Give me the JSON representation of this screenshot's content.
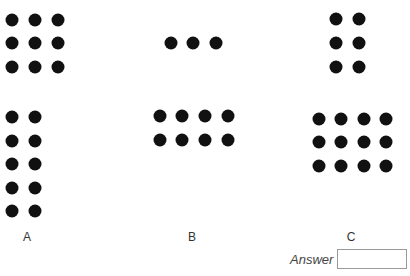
{
  "question": {
    "top_text_fragment": "",
    "options": [
      {
        "label": "A",
        "label_pos": [
          27,
          230
        ],
        "groups": [
          {
            "name": "top-grid",
            "cols_x": [
              12,
              35,
              58
            ],
            "rows_y": [
              20,
              43,
              67
            ]
          },
          {
            "name": "bottom-grid",
            "cols_x": [
              12,
              35
            ],
            "rows_y": [
              117,
              141,
              164,
              188,
              211
            ]
          }
        ]
      },
      {
        "label": "B",
        "label_pos": [
          192,
          230
        ],
        "groups": [
          {
            "name": "top-row",
            "cols_x": [
              171,
              193,
              216
            ],
            "rows_y": [
              43
            ]
          },
          {
            "name": "bottom-grid",
            "cols_x": [
              160,
              182,
              205,
              228
            ],
            "rows_y": [
              116,
              140
            ]
          }
        ]
      },
      {
        "label": "C",
        "label_pos": [
          351,
          230
        ],
        "groups": [
          {
            "name": "top-grid",
            "cols_x": [
              336,
              359
            ],
            "rows_y": [
              19,
              43,
              67
            ]
          },
          {
            "name": "bottom-grid",
            "cols_x": [
              319,
              341,
              364,
              386
            ],
            "rows_y": [
              119,
              142,
              166
            ]
          }
        ]
      }
    ],
    "answer": {
      "label": "Answer",
      "value": ""
    }
  }
}
